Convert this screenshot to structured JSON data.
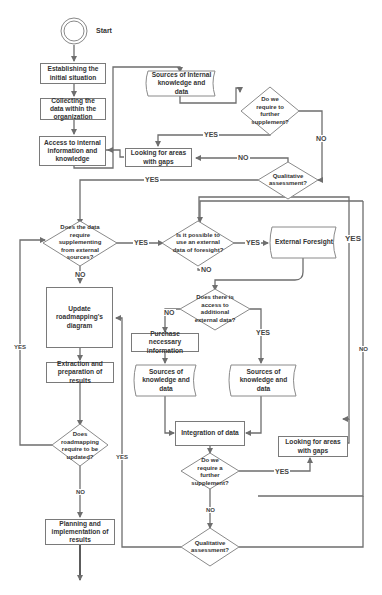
{
  "diagram": {
    "type": "flowchart",
    "start": {
      "label": "Start"
    },
    "nodes": {
      "establish": "Establishing the initial situation",
      "collect": "Collecting the data within the organization",
      "access": "Access to internal information and knowledge",
      "sources_internal": "Sources of Internal knowledge and data",
      "req_further_1": "Do we require to further supplement?",
      "looking_gaps_1": "Looking for areas with gaps",
      "qual_1": "Qualitative assessment?",
      "data_supplement": "Does the data require supplementing from external sources?",
      "ext_foresight_q": "Is it possible to use an external data of foresight?",
      "ext_foresight": "External Foresight",
      "access_additional": "Does there is access to additional external data?",
      "purchase": "Purchase necessary information",
      "sources_left": "Sources of knowledge and data",
      "sources_right": "Sources of knowledge and data",
      "integration": "Integration of data",
      "req_further_2": "Do we require a further supplement?",
      "looking_gaps_2": "Looking for areas with gaps",
      "qual_2": "Qualitative assessment?",
      "update": "Update roadmapping's diagram",
      "extraction": "Extraction and preparation of results",
      "roadmap_update_q": "Does roadmapping require to be updated?",
      "planning": "Planning and implementation of results"
    },
    "labels": {
      "yes": "YES",
      "no": "NO"
    },
    "colors": {
      "line": "#6e6e6e",
      "border": "#7a7a7a",
      "text": "#333333",
      "background": "#ffffff"
    }
  }
}
